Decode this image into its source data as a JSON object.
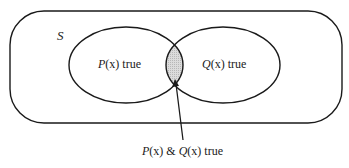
{
  "diagram": {
    "type": "venn",
    "universe": {
      "label": "S"
    },
    "sets": [
      {
        "name": "P",
        "label_pre": "P",
        "label_var": "(x)",
        "label_post": " true"
      },
      {
        "name": "Q",
        "label_pre": "Q",
        "label_var": "(x)",
        "label_post": " true"
      }
    ],
    "intersection": {
      "label_p": "P",
      "label_px": "(x)",
      "label_amp": " & ",
      "label_q": "Q",
      "label_qx": "(x)",
      "label_post": " true",
      "fill": "#d4d4d4"
    },
    "stroke_color": "#1a1a1a"
  }
}
